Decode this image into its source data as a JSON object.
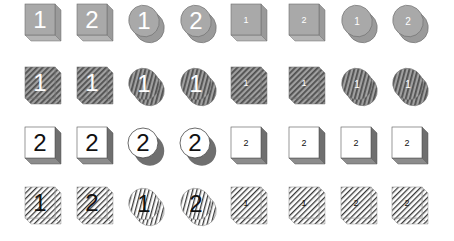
{
  "columns_x": [
    24,
    76,
    127,
    179,
    230,
    288,
    340,
    391
  ],
  "rows": [
    {
      "name": "gray-solid",
      "y": 3,
      "style": "gray",
      "items": [
        {
          "shape": "cube",
          "label": "1",
          "size": "large"
        },
        {
          "shape": "cube",
          "label": "2",
          "size": "large"
        },
        {
          "shape": "ellipse",
          "label": "1",
          "size": "large"
        },
        {
          "shape": "ellipse",
          "label": "2",
          "size": "large"
        },
        {
          "shape": "cube",
          "label": "1",
          "size": "small"
        },
        {
          "shape": "cube",
          "label": "2",
          "size": "small"
        },
        {
          "shape": "ellipse",
          "label": "1",
          "size": "small"
        },
        {
          "shape": "ellipse",
          "label": "2",
          "size": "small"
        }
      ]
    },
    {
      "name": "gray-hatched",
      "y": 66,
      "style": "darkhatch",
      "items": [
        {
          "shape": "cube",
          "label": "1",
          "size": "large"
        },
        {
          "shape": "cube",
          "label": "1",
          "size": "large"
        },
        {
          "shape": "ellipse",
          "label": "1",
          "size": "large"
        },
        {
          "shape": "ellipse",
          "label": "1",
          "size": "large"
        },
        {
          "shape": "cube",
          "label": "1",
          "size": "small"
        },
        {
          "shape": "cube",
          "label": "1",
          "size": "small"
        },
        {
          "shape": "ellipse",
          "label": "1",
          "size": "small"
        },
        {
          "shape": "ellipse",
          "label": "1",
          "size": "small"
        }
      ]
    },
    {
      "name": "white-shadow",
      "y": 126,
      "style": "white",
      "items": [
        {
          "shape": "cube",
          "label": "2",
          "size": "large"
        },
        {
          "shape": "cube",
          "label": "2",
          "size": "large"
        },
        {
          "shape": "circle",
          "label": "2",
          "size": "large"
        },
        {
          "shape": "circle",
          "label": "2",
          "size": "large"
        },
        {
          "shape": "cube",
          "label": "2",
          "size": "small"
        },
        {
          "shape": "cube",
          "label": "2",
          "size": "small"
        },
        {
          "shape": "cube",
          "label": "2",
          "size": "small"
        },
        {
          "shape": "cube",
          "label": "2",
          "size": "small"
        }
      ]
    },
    {
      "name": "light-hatched",
      "y": 186,
      "style": "lighthatch",
      "items": [
        {
          "shape": "cube",
          "label": "1",
          "size": "large"
        },
        {
          "shape": "cube",
          "label": "2",
          "size": "large"
        },
        {
          "shape": "ellipse",
          "label": "1",
          "size": "large"
        },
        {
          "shape": "ellipse",
          "label": "2",
          "size": "large"
        },
        {
          "shape": "cube",
          "label": "1",
          "size": "small"
        },
        {
          "shape": "cube",
          "label": "1",
          "size": "small"
        },
        {
          "shape": "cube",
          "label": "2",
          "size": "small"
        },
        {
          "shape": "cube",
          "label": "2",
          "size": "small"
        }
      ]
    }
  ],
  "colors": {
    "gray_fill": "#a9a9a9",
    "gray_side": "#9a9a9a",
    "gray_bottom": "#b4b4b4",
    "outline": "#6e6e6e",
    "white_fill": "#ffffff",
    "shadow": "#6f6f6f",
    "shadow_bottom": "#8c8c8c",
    "hatch_dark": "#4a4a4a",
    "hatch_light_bg": "#ffffff",
    "digit_light": "#ffffff",
    "digit_dark": "#111111"
  }
}
